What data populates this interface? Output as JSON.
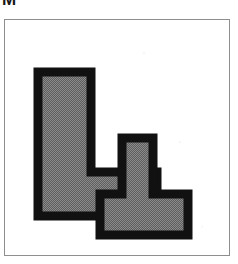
{
  "figure": {
    "label": "M",
    "frame": {
      "border_color": "#8e8e8e",
      "background_color": "#ffffff"
    },
    "palette": {
      "outline": "#111111",
      "fill_gray": "#808080",
      "background": "#ffffff"
    },
    "shapes": [
      {
        "name": "large-l-polygon",
        "description": "Large L-shaped polygon, upper left",
        "points": "33,52 33,196 152,196 152,152 86,152 86,52"
      },
      {
        "name": "small-l-polygon",
        "description": "Small L-shaped polygon, lower right, interlocking",
        "points": "117,118 117,174 95,174 95,215 183,215 183,174 148,174 148,118"
      }
    ]
  }
}
